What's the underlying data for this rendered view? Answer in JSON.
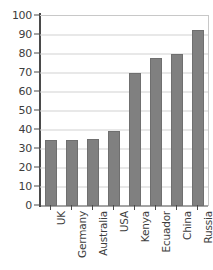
{
  "chart_data": {
    "type": "bar",
    "title": "",
    "subtitle": "",
    "xlabel": "",
    "ylabel": "",
    "categories": [
      "UK",
      "Germany",
      "Australia",
      "USA",
      "Kenya",
      "Ecuador",
      "China",
      "Russia"
    ],
    "values": [
      35,
      35,
      35.5,
      39.5,
      70,
      78,
      80,
      92.5
    ],
    "ylim": [
      0,
      100
    ],
    "ytick_labels": [
      "100",
      "90",
      "80",
      "70",
      "60",
      "50",
      "40",
      "30",
      "20",
      "10",
      "0"
    ],
    "ytick_values": [
      100,
      90,
      80,
      70,
      60,
      50,
      40,
      30,
      20,
      10,
      0
    ],
    "ytick_step": 10,
    "grid": true,
    "grid_axis": "y",
    "legend": false,
    "legend_position": "none",
    "bar_color": "#808080",
    "grid_color": "#d2d2d2",
    "axis_color": "#4a4a4a",
    "frame_color": "#c8c8c8",
    "background_color": "#ffffff",
    "xtick_label_rotation": 90
  }
}
